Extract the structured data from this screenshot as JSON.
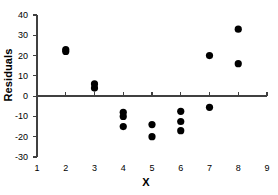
{
  "chart_data": {
    "type": "scatter",
    "title": "",
    "xlabel": "X",
    "ylabel": "Residuals",
    "xlim": [
      1,
      9
    ],
    "ylim": [
      -30,
      40
    ],
    "xticks": [
      1,
      2,
      3,
      4,
      5,
      6,
      7,
      8,
      9
    ],
    "yticks": [
      -30,
      -20,
      -10,
      0,
      10,
      20,
      30,
      40
    ],
    "xtick_labels": [
      "1",
      "2",
      "3",
      "4",
      "5",
      "6",
      "7",
      "8",
      "9"
    ],
    "ytick_labels": [
      "-30",
      "-20",
      "-10",
      "0",
      "10",
      "20",
      "30",
      "40"
    ],
    "grid": false,
    "legend": false,
    "zero_line": 0,
    "marker": {
      "shape": "circle",
      "color": "#000000",
      "size": 5
    },
    "axis_color": "#404040",
    "series": [
      {
        "name": "Residuals",
        "points": [
          {
            "x": 2,
            "y": 23
          },
          {
            "x": 2,
            "y": 22
          },
          {
            "x": 3,
            "y": 6
          },
          {
            "x": 3,
            "y": 4
          },
          {
            "x": 4,
            "y": -8
          },
          {
            "x": 4,
            "y": -10
          },
          {
            "x": 4,
            "y": -15
          },
          {
            "x": 5,
            "y": -14
          },
          {
            "x": 5,
            "y": -20
          },
          {
            "x": 6,
            "y": -7.5
          },
          {
            "x": 6,
            "y": -12.5
          },
          {
            "x": 6,
            "y": -17
          },
          {
            "x": 7,
            "y": 20
          },
          {
            "x": 7,
            "y": -5.5
          },
          {
            "x": 8,
            "y": 33
          },
          {
            "x": 8,
            "y": 16
          }
        ]
      }
    ]
  }
}
